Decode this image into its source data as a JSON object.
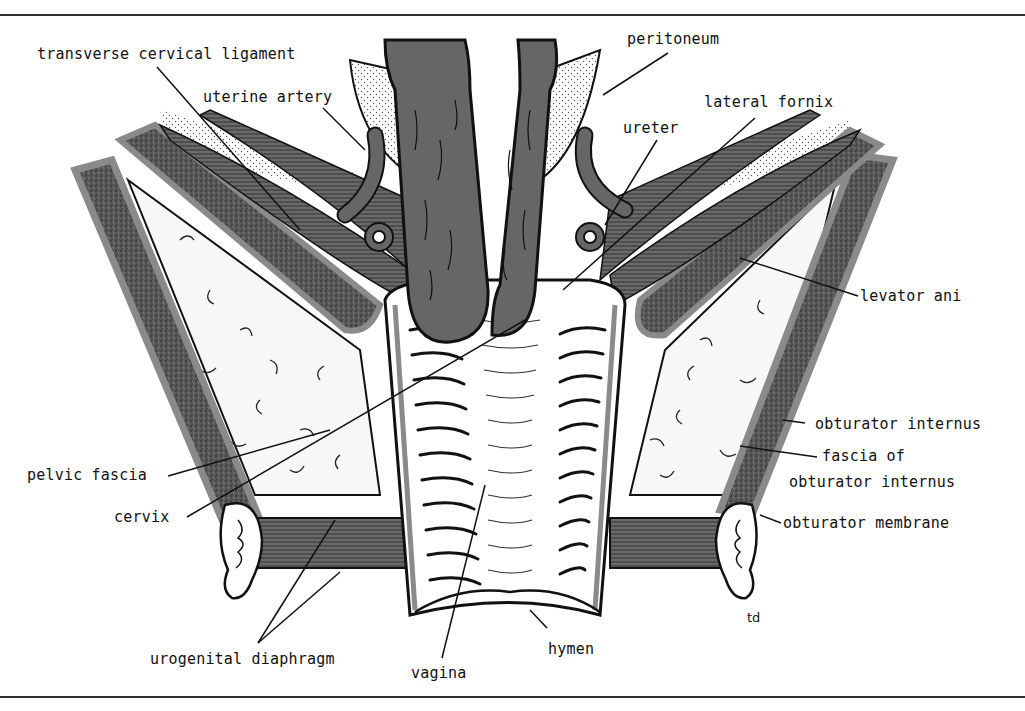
{
  "figure": {
    "signature": "td",
    "colors": {
      "muscle": "#666666",
      "fascia": "#8a8a8a",
      "outline": "#111111",
      "background": "#ffffff",
      "fat_fill": "#f6f6f6",
      "stipple": "#444444"
    }
  },
  "labels": {
    "transverse_cervical_ligament": "transverse cervical ligament",
    "uterine_artery": "uterine artery",
    "peritoneum": "peritoneum",
    "lateral_fornix": "lateral fornix",
    "ureter": "ureter",
    "levator_ani": "levator ani",
    "obturator_internus": "obturator internus",
    "fascia_of_1": "fascia of",
    "fascia_of_2": "obturator internus",
    "obturator_membrane": "obturator membrane",
    "pelvic_fascia": "pelvic fascia",
    "cervix": "cervix",
    "urogenital_diaphragm": "urogenital diaphragm",
    "vagina": "vagina",
    "hymen": "hymen"
  }
}
